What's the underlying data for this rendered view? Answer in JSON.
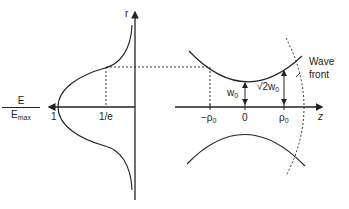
{
  "left_panel": {
    "axis_r_label": "r",
    "ratio_numerator": "E",
    "ratio_denominator": "E",
    "ratio_denominator_sub": "max",
    "tick_one": "1",
    "tick_inv_e": "1/e"
  },
  "right_panel": {
    "tick_neg_rho": "−ρ",
    "tick_neg_rho_sub": "0",
    "tick_zero": "0",
    "tick_rho": "ρ",
    "tick_rho_sub": "0",
    "axis_z_label": "z",
    "w0_label": "w",
    "w0_sub": "0",
    "sqrt2_label": "√2w",
    "sqrt2_sub": "0",
    "wavefront_line1": "Wave",
    "wavefront_line2": "front"
  },
  "colors": {
    "ink": "#222222",
    "background": "#ffffff"
  }
}
